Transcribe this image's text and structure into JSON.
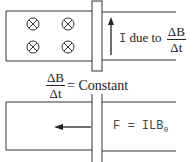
{
  "top_diagram": {
    "field_symbol": "⊗",
    "field_symbol_count": 4,
    "current_label_prefix": "I",
    "current_label_text": "due to",
    "fraction_numerator": "ΔB",
    "fraction_denominator": "Δt"
  },
  "middle_equation": {
    "numerator": "ΔB",
    "denominator": "Δt",
    "rhs": "= Constant"
  },
  "bottom_diagram": {
    "force_label": "F = ILB",
    "force_subscript": "0"
  },
  "colors": {
    "line": "#333333",
    "text": "#222222",
    "background": "#ffffff"
  }
}
